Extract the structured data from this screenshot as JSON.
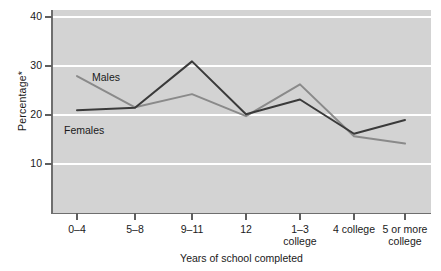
{
  "chart_data": {
    "type": "line",
    "title": "",
    "xlabel": "Years of school completed",
    "ylabel": "Percentage*",
    "categories": [
      "0–4",
      "5–8",
      "9–11",
      "12",
      "1–3 college",
      "4 college",
      "5 or more college"
    ],
    "category_lines": [
      [
        "0–4",
        ""
      ],
      [
        "5–8",
        ""
      ],
      [
        "9–11",
        ""
      ],
      [
        "12",
        ""
      ],
      [
        "1–3",
        "college"
      ],
      [
        "4 college",
        ""
      ],
      [
        "5 or more",
        "college"
      ]
    ],
    "yticks": [
      10,
      20,
      30,
      40
    ],
    "ytick_labels": [
      "10",
      "20",
      "30",
      "40"
    ],
    "ylim": [
      0,
      41.5
    ],
    "grid": "horizontal-white",
    "legend": "inline-labels",
    "series": [
      {
        "name": "Males",
        "color": "#8a8a8a",
        "values": [
          28.0,
          21.6,
          24.3,
          19.8,
          26.3,
          15.7,
          14.2
        ]
      },
      {
        "name": "Females",
        "color": "#3a3a3a",
        "values": [
          21.0,
          21.5,
          31.0,
          20.2,
          23.2,
          16.2,
          19.0
        ]
      }
    ],
    "plot_background": "#d3d3d3",
    "gridline_color": "#ffffff",
    "axis_color": "#6e6e6e"
  },
  "annotations": {
    "males_tag": "Males",
    "females_tag": "Females"
  }
}
